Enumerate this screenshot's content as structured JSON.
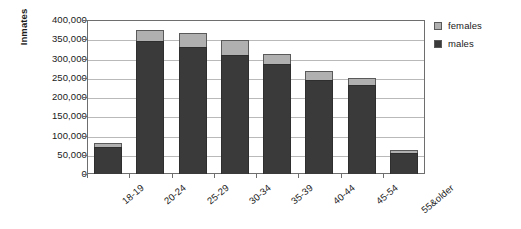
{
  "chart_data": {
    "type": "bar",
    "stacked": true,
    "title": "",
    "xlabel": "",
    "ylabel": "Inmates",
    "ylim": [
      0,
      400000
    ],
    "ytick_labels": [
      "400,000",
      "350,000",
      "300,000",
      "250,000",
      "200,000",
      "150,000",
      "100,000",
      "50,000",
      "0"
    ],
    "ytick_values": [
      400000,
      350000,
      300000,
      250000,
      200000,
      150000,
      100000,
      50000,
      0
    ],
    "grid": true,
    "legend_position": "right",
    "categories": [
      "18-19",
      "20-24",
      "25-29",
      "30-34",
      "35-39",
      "40-44",
      "45-54",
      "55&older"
    ],
    "series": [
      {
        "name": "males",
        "color": "#3a3a3a",
        "values": [
          70000,
          345000,
          330000,
          310000,
          285000,
          245000,
          230000,
          55000
        ]
      },
      {
        "name": "females",
        "color": "#b0b0b0",
        "values": [
          10000,
          30000,
          35000,
          38000,
          27000,
          23000,
          20000,
          7000
        ]
      }
    ],
    "totals": [
      80000,
      375000,
      365000,
      348000,
      312000,
      268000,
      250000,
      62000
    ]
  },
  "legend": {
    "items": [
      {
        "label": "females",
        "color": "#b0b0b0"
      },
      {
        "label": "males",
        "color": "#3a3a3a"
      }
    ]
  },
  "colors": {
    "males": "#3a3a3a",
    "females": "#b0b0b0",
    "axis": "#6e6e6e",
    "grid": "#b9b9b9",
    "text": "#1a1a1a",
    "background": "#ffffff"
  }
}
